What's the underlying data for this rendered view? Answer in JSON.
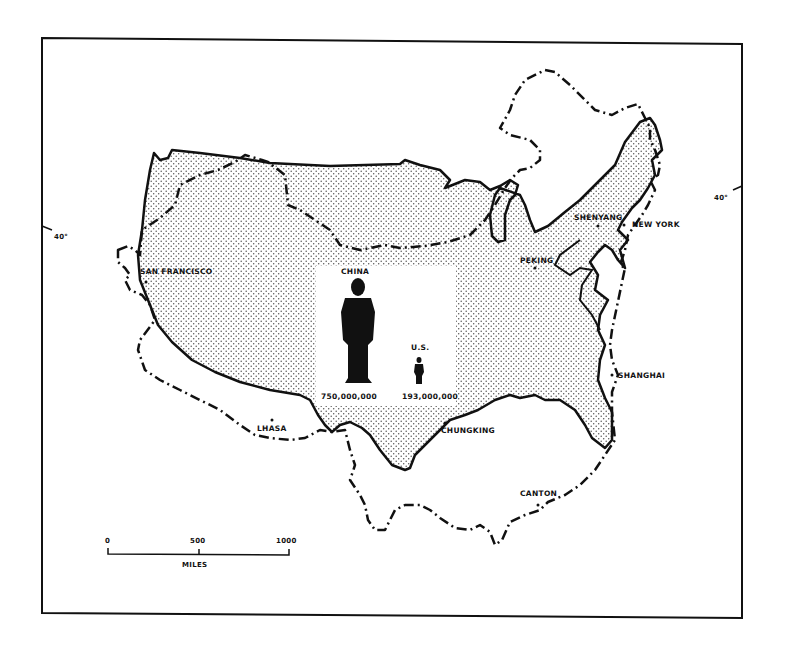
{
  "map": {
    "frame": {
      "x": 42,
      "y": 38,
      "w": 700,
      "h": 580
    },
    "colors": {
      "ink": "#111111",
      "paper": "#ffffff",
      "stipple": "#555555"
    },
    "latitude_markers": [
      {
        "label": "40°",
        "side": "left"
      },
      {
        "label": "40°",
        "side": "right"
      }
    ],
    "cities": [
      {
        "name": "SAN FRANCISCO"
      },
      {
        "name": "NEW YORK"
      },
      {
        "name": "SHENYANG"
      },
      {
        "name": "PEKING"
      },
      {
        "name": "SHANGHAI"
      },
      {
        "name": "CHUNGKING"
      },
      {
        "name": "LHASA"
      },
      {
        "name": "CANTON"
      }
    ],
    "population_comparison": {
      "china": {
        "label": "CHINA",
        "population": "750,000,000"
      },
      "us": {
        "label": "U.S.",
        "population": "193,000,000"
      }
    },
    "scale_bar": {
      "ticks": [
        "0",
        "500",
        "1000"
      ],
      "unit": "MILES"
    },
    "legend": {
      "us_outline": "solid line with stipple fill",
      "china_outline": "dash-dot line"
    }
  }
}
